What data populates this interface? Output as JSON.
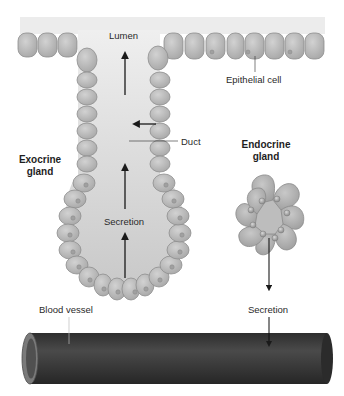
{
  "labels": {
    "lumen": "Lumen",
    "epithelial_cell": "Epithelial cell",
    "duct": "Duct",
    "exocrine_gland_line1": "Exocrine",
    "exocrine_gland_line2": "gland",
    "endocrine_gland_line1": "Endocrine",
    "endocrine_gland_line2": "gland",
    "exocrine_secretion": "Secretion",
    "endocrine_secretion": "Secretion",
    "blood_vessel": "Blood vessel"
  },
  "colors": {
    "cell_fill": "#b9b9b9",
    "cell_stroke": "#8e8e8e",
    "lumen_bg": "#e6e6e6",
    "vessel_dark": "#3a3a3a",
    "arrow": "#1a1a1a"
  }
}
